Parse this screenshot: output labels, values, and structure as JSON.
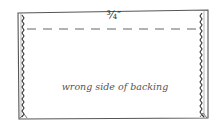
{
  "diagram": {
    "seam_allowance_label": "¾″",
    "caption": "wrong side of backing",
    "elements": {
      "outline": "rectangle",
      "side_edges": "zigzag finished edges (left and right)",
      "seam_line": "dashed line near top edge"
    },
    "colors": {
      "line": "#444444",
      "text": "#555555",
      "background": "#ffffff"
    }
  }
}
